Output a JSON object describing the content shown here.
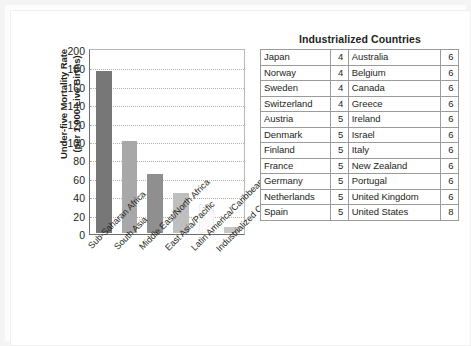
{
  "chart_data": {
    "type": "bar",
    "title": "",
    "xlabel": "",
    "ylabel": "Under-five Mortality Rate\n(per 1,000 Live Births)",
    "ylim": [
      0,
      200
    ],
    "ytick_step": 20,
    "yticks": [
      200,
      180,
      160,
      140,
      120,
      100,
      80,
      60,
      40,
      20,
      0
    ],
    "grid": true,
    "legend": "none",
    "categories": [
      "Sub-Saharan Africa",
      "South Asia",
      "Middle East/North Africa",
      "East Asia/Pacific",
      "Latin America/Caribbean",
      "Industrialized Countries"
    ],
    "values": [
      176,
      100,
      64,
      44,
      32,
      6
    ],
    "bar_colors": [
      "#777777",
      "#a8a8a8",
      "#8f8f8f",
      "#bfbfbf",
      "#fafafa",
      "#c6c6c6"
    ]
  },
  "chart": {
    "y_axis_title": "Under-five Mortality Rate\n(per 1,000 Live Births)",
    "y_ticks": [
      "200",
      "180",
      "160",
      "140",
      "120",
      "100",
      "80",
      "60",
      "40",
      "20",
      "0"
    ],
    "x_labels": [
      "Sub-Saharan Africa",
      "South Asia",
      "Middle East/North Africa",
      "East Asia/Pacific",
      "Latin America/Caribbean",
      "Industrialized Countries"
    ]
  },
  "table": {
    "title": "Industrialized Countries",
    "rows": [
      {
        "name_l": "Japan",
        "val_l": "4",
        "name_r": "Australia",
        "val_r": "6"
      },
      {
        "name_l": "Norway",
        "val_l": "4",
        "name_r": "Belgium",
        "val_r": "6"
      },
      {
        "name_l": "Sweden",
        "val_l": "4",
        "name_r": "Canada",
        "val_r": "6"
      },
      {
        "name_l": "Switzerland",
        "val_l": "4",
        "name_r": "Greece",
        "val_r": "6"
      },
      {
        "name_l": "Austria",
        "val_l": "5",
        "name_r": "Ireland",
        "val_r": "6"
      },
      {
        "name_l": "Denmark",
        "val_l": "5",
        "name_r": "Israel",
        "val_r": "6"
      },
      {
        "name_l": "Finland",
        "val_l": "5",
        "name_r": "Italy",
        "val_r": "6"
      },
      {
        "name_l": "France",
        "val_l": "5",
        "name_r": "New Zealand",
        "val_r": "6"
      },
      {
        "name_l": "Germany",
        "val_l": "5",
        "name_r": "Portugal",
        "val_r": "6"
      },
      {
        "name_l": "Netherlands",
        "val_l": "5",
        "name_r": "United Kingdom",
        "val_r": "6"
      },
      {
        "name_l": "Spain",
        "val_l": "5",
        "name_r": "United States",
        "val_r": "8"
      }
    ]
  },
  "colors": {
    "text": "#231f20",
    "axis": "#6e6e6e",
    "grid": "#b0b0b0",
    "table_border": "#9b9b9b",
    "page_frame": "#f4f4f4"
  }
}
